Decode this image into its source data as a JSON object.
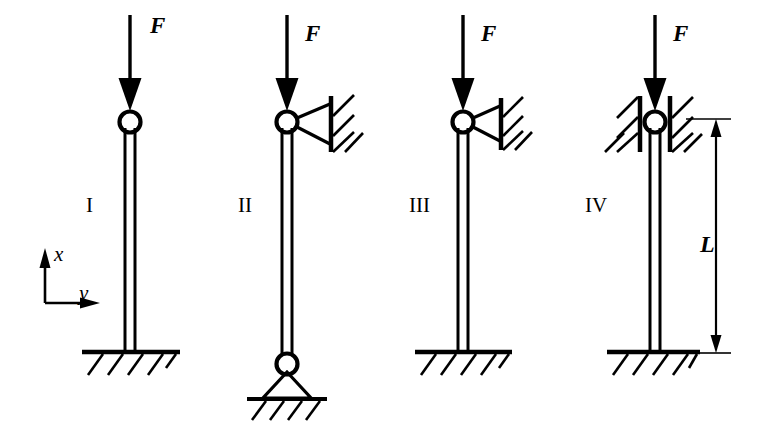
{
  "figure": {
    "background_color": "#ffffff",
    "line_color": "#000000",
    "width": 766,
    "height": 436
  },
  "labels": {
    "force": "F",
    "length": "L",
    "axis_vertical": "x",
    "axis_horizontal": "y"
  },
  "columns": [
    {
      "id": "I",
      "label": "I",
      "force_label": "F",
      "top_condition": "free-pin",
      "bottom_condition": "fixed",
      "center_x": 130,
      "label_x": 86,
      "label_y": 200
    },
    {
      "id": "II",
      "label": "II",
      "force_label": "F",
      "top_condition": "pin-with-horizontal-link",
      "bottom_condition": "pinned",
      "center_x": 287,
      "label_x": 238,
      "label_y": 200
    },
    {
      "id": "III",
      "label": "III",
      "force_label": "F",
      "top_condition": "pin-with-horizontal-link",
      "bottom_condition": "fixed",
      "center_x": 463,
      "label_x": 409,
      "label_y": 200
    },
    {
      "id": "IV",
      "label": "IV",
      "force_label": "F",
      "top_condition": "guided-fixed",
      "bottom_condition": "fixed",
      "center_x": 655,
      "label_x": 585,
      "label_y": 200
    }
  ],
  "dimension": {
    "label": "L",
    "label_x": 706,
    "label_y": 243,
    "line_x": 716,
    "top_y": 119,
    "bottom_y": 352
  },
  "axes": {
    "origin_x": 45,
    "origin_y": 303,
    "vertical_label": "x",
    "vertical_label_x": 53,
    "vertical_label_y": 246,
    "horizontal_label": "y",
    "horizontal_label_x": 78,
    "horizontal_label_y": 287
  }
}
